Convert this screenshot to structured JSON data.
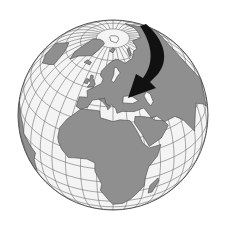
{
  "map": {
    "title": "Orthographic globe centered on Europe and Africa",
    "projection": "orthographic",
    "center": {
      "lon": 20,
      "lat": 35
    },
    "graticule_step_deg": 10,
    "colors": {
      "ocean": "#f4f4f4",
      "land": "#8f8f8f",
      "border": "#4a4a4a",
      "graticule": "#6e6e6e",
      "ice": "#f8f8f8",
      "arrow": "#111111",
      "outline": "#555555"
    },
    "annotation": {
      "type": "curved-arrow",
      "description": "Black arrow curving from the Arctic down into Eastern Europe",
      "from": {
        "lon": 60,
        "lat": 72
      },
      "to": {
        "lon": 25,
        "lat": 53
      }
    },
    "regions": [
      {
        "name": "Europe",
        "kind": "land"
      },
      {
        "name": "Africa",
        "kind": "land"
      },
      {
        "name": "Asia",
        "kind": "land"
      },
      {
        "name": "Greenland",
        "kind": "ice"
      },
      {
        "name": "Arctic ice cap",
        "kind": "ice"
      },
      {
        "name": "South America (edge)",
        "kind": "land"
      },
      {
        "name": "Arabian Peninsula",
        "kind": "land"
      }
    ]
  }
}
